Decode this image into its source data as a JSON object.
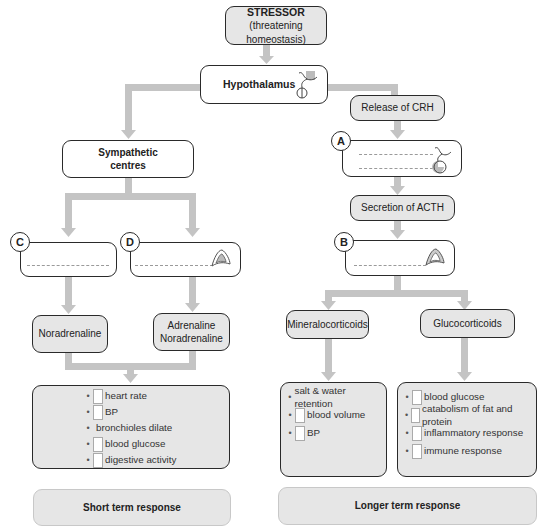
{
  "stressor": {
    "title": "STRESSOR",
    "subtitle": "(threatening homeostasis)"
  },
  "hypothalamus": {
    "label": "Hypothalamus",
    "icon": "brain-pituitary-icon"
  },
  "right_branch": {
    "release": "Release of CRH",
    "box_a": {
      "marker": "A",
      "icon": "pituitary-icon"
    },
    "secretion": "Secretion of ACTH",
    "box_b": {
      "marker": "B",
      "icon": "adrenal-gland-icon"
    },
    "mineralocorticoids": "Mineralocorticoids",
    "glucocorticoids": "Glucocorticoids",
    "mineralo_effects": [
      {
        "text": "salt & water retention",
        "checkbox": false
      },
      {
        "text": "blood volume",
        "checkbox": true
      },
      {
        "text": "BP",
        "checkbox": true
      }
    ],
    "gluco_effects": [
      {
        "text": "blood glucose",
        "checkbox": true
      },
      {
        "text": "catabolism of fat and protein",
        "checkbox": true
      },
      {
        "text": "inflammatory response",
        "checkbox": true
      },
      {
        "text": "immune response",
        "checkbox": true
      }
    ],
    "response": "Longer term response"
  },
  "left_branch": {
    "sympathetic": {
      "line1": "Sympathetic",
      "line2": "centres"
    },
    "box_c": {
      "marker": "C"
    },
    "box_d": {
      "marker": "D",
      "icon": "adrenal-gland-icon"
    },
    "noradrenaline": "Noradrenaline",
    "adrenaline": {
      "line1": "Adrenaline",
      "line2": "Noradrenaline"
    },
    "effects": [
      {
        "text": "heart rate",
        "checkbox": true
      },
      {
        "text": "BP",
        "checkbox": true
      },
      {
        "text": "bronchioles dilate",
        "checkbox": false
      },
      {
        "text": "blood glucose",
        "checkbox": true
      },
      {
        "text": "digestive activity",
        "checkbox": true
      }
    ],
    "response": "Short term response"
  },
  "colors": {
    "connector": "#c4c4c4",
    "box_border": "#2a2a2a",
    "gray_fill": "#e6e6e6"
  }
}
